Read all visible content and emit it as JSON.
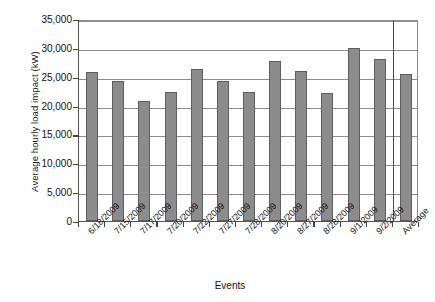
{
  "chart_data": {
    "type": "bar",
    "title": "",
    "xlabel": "Events",
    "ylabel": "Average hourly load impact (kW)",
    "ylim": [
      0,
      35000
    ],
    "ytick_labels": [
      "35,000",
      "30,000",
      "25,000",
      "20,000",
      "15,000",
      "10,000",
      "5,000",
      "0"
    ],
    "ytick_values": [
      35000,
      30000,
      25000,
      20000,
      15000,
      10000,
      5000,
      0
    ],
    "grid": true,
    "legend": "none",
    "categories": [
      "6/18/2009",
      "7/15/2009",
      "7/17/2009",
      "7/20/2009",
      "7/22/2009",
      "7/27/2009",
      "7/28/2009",
      "8/20/2009",
      "8/27/2009",
      "8/28/2009",
      "9/1/2009",
      "9/2/2009",
      "Average"
    ],
    "values": [
      25800,
      24300,
      20800,
      22400,
      26400,
      24300,
      22300,
      27800,
      26000,
      22100,
      30000,
      28000,
      25400
    ],
    "bar_color": "#8c8c8c",
    "bar_edge_color": "#5d5d5d",
    "grid_color": "#8d8d8d",
    "axis_color": "#555555",
    "separator_before_index": 12
  }
}
